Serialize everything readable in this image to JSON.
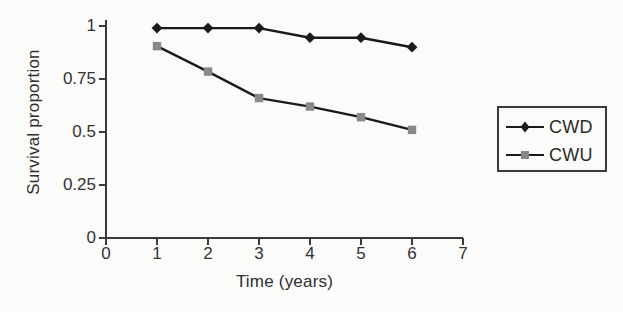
{
  "chart_data": {
    "type": "line",
    "title": "",
    "xlabel": "Time (years)",
    "ylabel": "Survival proportion",
    "xlim": [
      0,
      7
    ],
    "ylim": [
      0,
      1
    ],
    "grid": false,
    "legend_position": "right-outside",
    "x": [
      1,
      2,
      3,
      4,
      5,
      6
    ],
    "xticks": [
      "0",
      "1",
      "2",
      "3",
      "4",
      "5",
      "6",
      "7"
    ],
    "xtick_values": [
      0,
      1,
      2,
      3,
      4,
      5,
      6,
      7
    ],
    "yticks": [
      "0",
      "0.25",
      "0.5",
      "0.75",
      "1"
    ],
    "ytick_values": [
      0,
      0.25,
      0.5,
      0.75,
      1
    ],
    "series": [
      {
        "name": "CWD",
        "marker": "diamond",
        "marker_color": "#1a1a1a",
        "line_color": "#1a1a1a",
        "values": [
          0.99,
          0.99,
          0.99,
          0.945,
          0.945,
          0.9
        ]
      },
      {
        "name": "CWU",
        "marker": "square",
        "marker_color": "#888888",
        "line_color": "#1a1a1a",
        "values": [
          0.905,
          0.785,
          0.66,
          0.62,
          0.57,
          0.51
        ]
      }
    ]
  },
  "legend": {
    "items": [
      {
        "label": "CWD"
      },
      {
        "label": "CWU"
      }
    ]
  },
  "colors": {
    "axis": "#3a3a3a",
    "text": "#2e2e2e",
    "cwd": "#1a1a1a",
    "cwu": "#888888",
    "background": "#fbfbf9"
  }
}
